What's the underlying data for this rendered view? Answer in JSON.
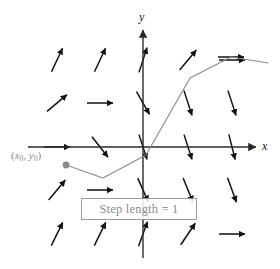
{
  "figure": {
    "background_color": "#ffffff",
    "width": 280,
    "height": 269
  },
  "axes": {
    "x_label": "x",
    "y_label": "y",
    "axis_color": "#2a2a2a",
    "origin": {
      "x": 143,
      "y": 147
    },
    "x_axis": {
      "x_start": 28,
      "x_end": 256,
      "y": 147
    },
    "y_axis": {
      "y_start": 30,
      "y_end": 258,
      "x": 143
    }
  },
  "annotations": {
    "initial_point_label": "(x0, y0)",
    "initial_point_label_color": "#8a8a8a",
    "initial_point": {
      "x": 66,
      "y": 165
    },
    "initial_point_color": "#8a8a8a",
    "step_length_text": "Step length  = 1",
    "step_length_text_color": "#8a8a8a",
    "step_length_border_color": "#9b9b9b"
  },
  "solution_curve": {
    "name": "euler-polygonal-path",
    "color": "#8a8a8a",
    "stroke_width": 1.1,
    "points": [
      {
        "x": 66,
        "y": 165
      },
      {
        "x": 103,
        "y": 178
      },
      {
        "x": 146,
        "y": 155
      },
      {
        "x": 190,
        "y": 78
      },
      {
        "x": 231,
        "y": 57
      },
      {
        "x": 268,
        "y": 63
      }
    ]
  },
  "chart_data": {
    "type": "scatter",
    "xlabel": "x",
    "ylabel": "y",
    "grid": false,
    "legend": "none",
    "annotations": [
      "(x0, y0)",
      "Step length  = 1"
    ],
    "field_description": "Slope field of short double-headed arrows arranged on a 5-column by 5-row grid; slope depends on position.",
    "arrow_color": "#111111",
    "arrow_length": 26,
    "grid_columns_px": [
      57,
      100,
      143,
      188,
      232
    ],
    "grid_rows_px": [
      60,
      103,
      147,
      190,
      234
    ],
    "slope_field": [
      {
        "x": 57,
        "y": 60,
        "angle_deg": 65
      },
      {
        "x": 100,
        "y": 60,
        "angle_deg": 65
      },
      {
        "x": 143,
        "y": 60,
        "angle_deg": 72
      },
      {
        "x": 188,
        "y": 60,
        "angle_deg": 50
      },
      {
        "x": 232,
        "y": 60,
        "angle_deg": 0
      },
      {
        "x": 57,
        "y": 103,
        "angle_deg": 40
      },
      {
        "x": 100,
        "y": 103,
        "angle_deg": 0
      },
      {
        "x": 143,
        "y": 103,
        "angle_deg": -60
      },
      {
        "x": 188,
        "y": 103,
        "angle_deg": -72
      },
      {
        "x": 232,
        "y": 103,
        "angle_deg": -72
      },
      {
        "x": 57,
        "y": 147,
        "angle_deg": 0
      },
      {
        "x": 100,
        "y": 147,
        "angle_deg": -52
      },
      {
        "x": 143,
        "y": 147,
        "angle_deg": -72
      },
      {
        "x": 188,
        "y": 147,
        "angle_deg": -72
      },
      {
        "x": 232,
        "y": 147,
        "angle_deg": -76
      },
      {
        "x": 57,
        "y": 190,
        "angle_deg": 50
      },
      {
        "x": 100,
        "y": 190,
        "angle_deg": 0
      },
      {
        "x": 143,
        "y": 190,
        "angle_deg": -66
      },
      {
        "x": 188,
        "y": 190,
        "angle_deg": -68
      },
      {
        "x": 232,
        "y": 190,
        "angle_deg": -70
      },
      {
        "x": 57,
        "y": 234,
        "angle_deg": 64
      },
      {
        "x": 100,
        "y": 234,
        "angle_deg": 64
      },
      {
        "x": 143,
        "y": 234,
        "angle_deg": 70
      },
      {
        "x": 188,
        "y": 234,
        "angle_deg": 56
      },
      {
        "x": 232,
        "y": 234,
        "angle_deg": 0
      },
      {
        "x": 231,
        "y": 57,
        "angle_deg": 0
      }
    ]
  }
}
